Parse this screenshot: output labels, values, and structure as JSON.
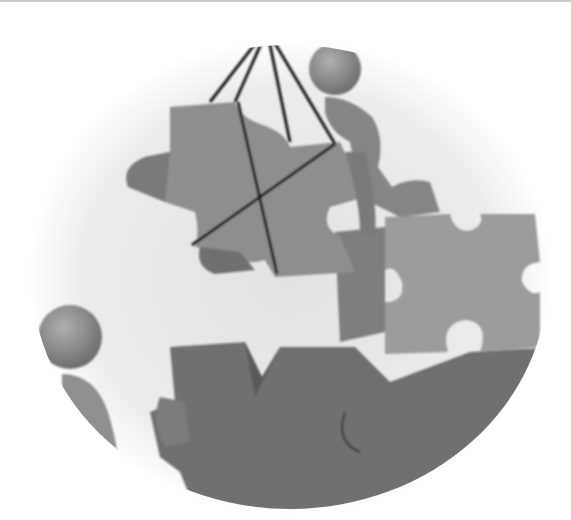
{
  "image": {
    "description": "Grayscale 3D illustration inside a soft circular vignette: a figure on top of puzzle pieces helps lift a puzzle piece suspended by four ropes, while another figure watches from the lower left.",
    "palette": {
      "background": "#ffffff",
      "vignette": "#e6e6e6",
      "piece_light": "#9a9a9a",
      "piece_mid": "#808080",
      "piece_dark": "#6a6a6a",
      "rope": "#1a1a1a",
      "figure": "#8a8a8a"
    },
    "elements": [
      {
        "name": "suspended-puzzle-piece"
      },
      {
        "name": "lifting-ropes",
        "count": 4
      },
      {
        "name": "climbing-figure"
      },
      {
        "name": "right-puzzle-piece"
      },
      {
        "name": "bottom-puzzle-pieces"
      },
      {
        "name": "watching-figure"
      }
    ]
  }
}
